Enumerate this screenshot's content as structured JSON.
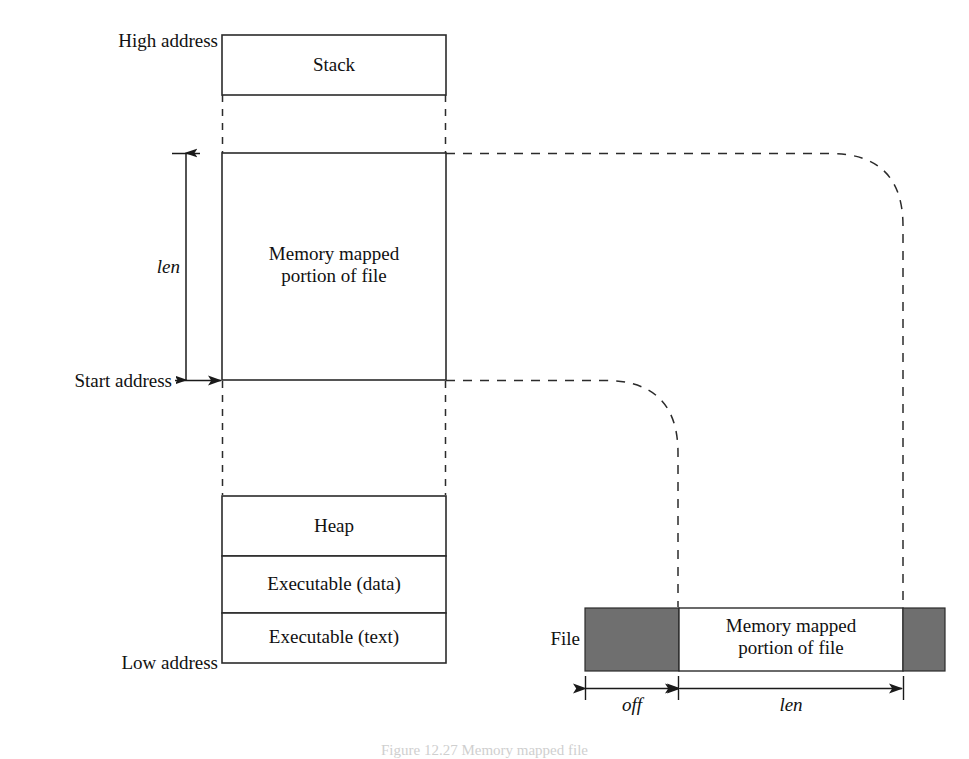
{
  "figure": {
    "caption": "Figure 12.27  Memory mapped file",
    "background": "#ffffff",
    "line_color": "#2b2b2b",
    "fill_gray": "#6f6f6f"
  },
  "memory_column": {
    "high_address_label": "High address",
    "low_address_label": "Low address",
    "start_address_label": "Start address",
    "len_label": "len",
    "segments": [
      {
        "name": "stack",
        "label": "Stack"
      },
      {
        "name": "mapped",
        "label_line1": "Memory mapped",
        "label_line2": "portion of file"
      },
      {
        "name": "heap",
        "label": "Heap"
      },
      {
        "name": "exec_data",
        "label": "Executable (data)"
      },
      {
        "name": "exec_text",
        "label": "Executable (text)"
      }
    ]
  },
  "file_bar": {
    "file_label": "File",
    "mapped_label_line1": "Memory mapped",
    "mapped_label_line2": "portion of file",
    "off_label": "off",
    "len_label": "len"
  }
}
